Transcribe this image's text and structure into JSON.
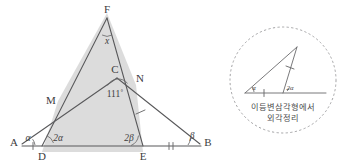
{
  "figure": {
    "colors": {
      "stroke": "#58585a",
      "shade": "#d9d9d9",
      "dashed_circle": "#9a9a9c",
      "text": "#3c3c3e"
    },
    "main": {
      "points": [
        {
          "id": "A",
          "label": "A",
          "x": 14,
          "y": 142
        },
        {
          "id": "B",
          "label": "B",
          "x": 206,
          "y": 142
        },
        {
          "id": "D",
          "label": "D",
          "x": 42,
          "y": 152
        },
        {
          "id": "E",
          "label": "E",
          "x": 143,
          "y": 152
        },
        {
          "id": "F",
          "label": "F",
          "x": 107,
          "y": 13
        },
        {
          "id": "C",
          "label": "C",
          "x": 117,
          "y": 76
        },
        {
          "id": "M",
          "label": "M",
          "x": 58,
          "y": 101
        },
        {
          "id": "N",
          "label": "N",
          "x": 136,
          "y": 85
        }
      ],
      "angles": [
        {
          "id": "angle-A",
          "label": "α",
          "vertex": "A",
          "x": 28,
          "y": 136
        },
        {
          "id": "angle-D",
          "label": "2α",
          "vertex": "D",
          "x": 56,
          "y": 136
        },
        {
          "id": "angle-E",
          "label": "2β",
          "vertex": "E",
          "x": 127,
          "y": 136
        },
        {
          "id": "angle-B",
          "label": "β",
          "vertex": "B",
          "x": 191,
          "y": 134
        },
        {
          "id": "angle-F",
          "label": "x",
          "vertex": "F",
          "x": 106,
          "y": 41
        },
        {
          "id": "angle-C",
          "label": "111˚",
          "vertex": "C",
          "x": 113,
          "y": 95
        }
      ],
      "segment_ticks": [
        {
          "id": "tick-AD",
          "on": "A-D"
        },
        {
          "id": "tick-EB",
          "on": "E-B",
          "count": 2
        },
        {
          "id": "tick-NE",
          "on": "N-E"
        }
      ]
    },
    "callout": {
      "id": "isosceles-exterior-angle-callout",
      "center": {
        "x": 283,
        "y": 80
      },
      "radius": 53,
      "caption_line1": "이등변삼각형에서",
      "caption_line2": "외각정리",
      "mini_angles": [
        {
          "id": "mini-angle-alpha",
          "label": "α",
          "x": 253,
          "y": 87
        },
        {
          "id": "mini-angle-2alpha",
          "label": "2α",
          "x": 288,
          "y": 87
        }
      ]
    }
  }
}
